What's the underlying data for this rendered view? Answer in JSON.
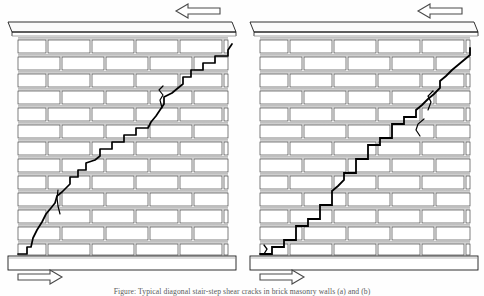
{
  "figure": {
    "kind": "technical-line-drawing",
    "panel_count": 2,
    "caption": "Figure: Typical diagonal stair-step shear cracks in brick masonry walls (a) and (b)",
    "colors": {
      "ink": "#1a1a1a",
      "crack": "#000000",
      "mortar_shade": "#b9b9b9",
      "brick_fill": "#ffffff",
      "paper": "#fefefe",
      "arrow_outline": "#4a4a4a"
    }
  },
  "annotations": {
    "top_arrow_label": "shear force to the left (top of wall)",
    "bottom_arrow_label": "shear force to the right (base of wall)",
    "top_arrow_direction": "left",
    "bottom_arrow_direction": "right"
  },
  "panels": [
    {
      "id": "panel-a",
      "name": "left-wall",
      "wall": {
        "name": "brick-masonry-wall",
        "courses": 13,
        "bond": "running-bond",
        "cap_label": "concrete cap beam",
        "footing_label": "concrete strip footing"
      },
      "cracks": [
        {
          "id": "crack-a-main",
          "name": "primary-stair-step-crack",
          "description": "continuous diagonal stair-step crack running from lower-left base up to upper-right under the cap beam",
          "path": "M 18,254 L 27,254 L 27,247 L 31,247 L 33,238 L 37,230 L 42,222 L 46,214 L 51,208 L 55,203 L 57,196 L 62,192 L 66,188 L 70,184 L 70,177 L 78,177 L 78,170 L 86,170 L 86,163 L 95,160 L 100,156 L 100,149 L 112,149 L 112,142 L 124,142 L 124,135 L 136,135 L 136,128 L 148,128 L 151,122 L 156,116 L 160,110 L 164,104 L 164,97 L 172,93 L 178,88 L 183,84 L 183,77 L 191,77 L 191,70 L 203,70 L 203,63 L 215,63 L 215,56 L 228,56 L 228,50 L 232,44"
        },
        {
          "id": "crack-a-branch-1",
          "name": "short-branch-crack-upper",
          "description": "short vertical hairline branch near mid-height right of the main crack",
          "path": "M 162,108 L 160,100 L 163,95 L 159,90 L 163,86"
        },
        {
          "id": "crack-a-branch-2",
          "name": "short-branch-crack-lower",
          "description": "short vertical hairline branch above the footing on the left",
          "path": "M 60,214 L 58,206 L 57,198 L 58,190"
        }
      ]
    },
    {
      "id": "panel-b",
      "name": "right-wall",
      "wall": {
        "name": "brick-masonry-wall",
        "courses": 13,
        "bond": "running-bond",
        "cap_label": "concrete cap beam",
        "footing_label": "concrete strip footing"
      },
      "cracks": [
        {
          "id": "crack-b-main",
          "name": "primary-stair-step-crack",
          "description": "pronounced stair-step crack with square treads and risers rising left to right across the wall",
          "path": "M 18,254 L 30,254 L 30,247 L 42,247 L 42,240 L 54,240 L 54,233 L 54,226 L 66,226 L 66,219 L 78,219 L 78,212 L 78,205 L 90,205 L 90,198 L 90,191 L 96,186 L 102,180 L 102,173 L 114,173 L 114,166 L 114,159 L 126,159 L 126,152 L 126,145 L 138,145 L 138,138 L 150,138 L 150,131 L 150,124 L 162,124 L 162,117 L 174,117 L 174,110 L 180,105 L 186,99 L 192,94 L 198,88 L 198,81 L 204,76 L 210,70 L 216,65 L 222,60 L 228,55 L 228,48"
        },
        {
          "id": "crack-b-branch-1",
          "name": "branch-crack-upper-right",
          "description": "short hook-shaped branch crack near the top right of the stair-step",
          "path": "M 186,110 L 189,102 L 186,96 L 191,91"
        },
        {
          "id": "crack-b-branch-2",
          "name": "branch-crack-mid",
          "description": "short inclined branch crack at mid-height",
          "path": "M 178,136 L 174,130 L 176,124 L 182,119"
        },
        {
          "id": "crack-b-branch-3",
          "name": "branch-crack-lower-left",
          "description": "short hairline at the base near the footing",
          "path": "M 22,254 L 25,249 L 22,245"
        }
      ]
    }
  ]
}
